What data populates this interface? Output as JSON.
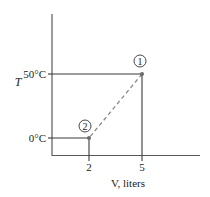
{
  "diagram": {
    "type": "state-diagram",
    "x_axis": {
      "label": "V, liters",
      "ticks": [
        {
          "label": "2",
          "value": 2
        },
        {
          "label": "5",
          "value": 5
        }
      ]
    },
    "y_axis": {
      "label": "T",
      "ticks": [
        {
          "label": "0°C",
          "value": 0
        },
        {
          "label": "50°C",
          "value": 50
        }
      ]
    },
    "points": [
      {
        "id": "1",
        "label": "1",
        "V": 5,
        "T": 50
      },
      {
        "id": "2",
        "label": "2",
        "V": 2,
        "T": 0
      }
    ],
    "path": {
      "from": "1",
      "to": "2",
      "style": "dashed"
    },
    "colors": {
      "axis": "#5a5a5a",
      "guide": "#3a3a3a",
      "dashed": "#8a8a8a",
      "point": "#6a6a6a",
      "text": "#222222"
    }
  }
}
